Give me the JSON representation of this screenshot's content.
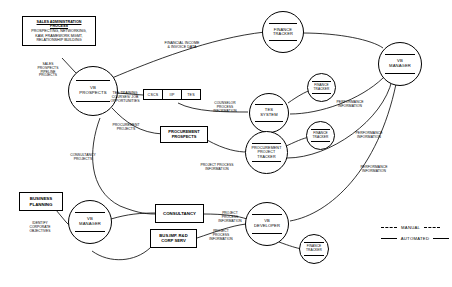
{
  "diagram": {
    "entities": [
      {
        "name": "sales-administration-process",
        "title": "SALES ADMINISTRATION",
        "title2": "PROCESS",
        "sub": "PROSPECTING, NETWORKING,\nKAM, FRAMEWORK MGMT,\nRELATIONSHIP BUILDING"
      },
      {
        "name": "procurement-prospects",
        "label": "PROCUREMENT\nPROSPECTS"
      },
      {
        "name": "business-planning",
        "label": "BUSINESS\nPLANNING"
      },
      {
        "name": "consultancy",
        "label": "CONSULTANCY"
      },
      {
        "name": "bus-imp-rd-corp-serv",
        "label": "BUS.IMP. R&D\nCORP SERV"
      }
    ],
    "processes": [
      {
        "name": "vb-prospects",
        "label": "VB\nPROSPECTS"
      },
      {
        "name": "finance-tracker-top",
        "label": "FINANCE\nTRACKER"
      },
      {
        "name": "vb-manager-right",
        "label": "VB\nMANAGER"
      },
      {
        "name": "finance-tracker-tes",
        "label": "FINANCE\nTRACKER"
      },
      {
        "name": "tes-system",
        "label": "TES\nSYSTEM"
      },
      {
        "name": "finance-tracker-procurement",
        "label": "FINANCE\nTRACKER"
      },
      {
        "name": "procurement-project-tracker",
        "label": "PROCUREMENT\nPROJECT\nTRACKER"
      },
      {
        "name": "vb-manager-bottom",
        "label": "VB\nMANAGER"
      },
      {
        "name": "vb-developer",
        "label": "VB\nDEVELOPER"
      },
      {
        "name": "finance-tracker-developer",
        "label": "FINANCE\nTRACKER"
      }
    ],
    "store": {
      "name": "accreditation-store",
      "cells": [
        "CSCS",
        "IIP",
        "TES"
      ]
    },
    "flows": [
      {
        "name": "flow-sales-prospects",
        "label": "SALES\nPROSPECTS\nPIPELINE\nPROJECTS"
      },
      {
        "name": "flow-financial-income",
        "label": "FINANCIAL INCOME\n& INVOICE DATA"
      },
      {
        "name": "flow-tes-training",
        "label": "TES TRAINING\nCOURSES/ JOB\nOPPORTUNITIES"
      },
      {
        "name": "flow-counselor-process",
        "label": "COUNSELOR\nPROCESS\nINFORMATION"
      },
      {
        "name": "flow-performance-top",
        "label": "PERFORMANCE\nINFORMATION"
      },
      {
        "name": "flow-procurement-projects",
        "label": "PROCUREMENT\nPROJECTS"
      },
      {
        "name": "flow-performance-mid",
        "label": "PERFORMANCE\nINFORMATION"
      },
      {
        "name": "flow-consultancy-projects",
        "label": "CONSULTANCY\nPROJECTS"
      },
      {
        "name": "flow-project-process-procurement",
        "label": "PROJECT PROCESS\nINFORMATION"
      },
      {
        "name": "flow-performance-low",
        "label": "PERFORMANCE\nINFORMATION"
      },
      {
        "name": "flow-identify-objectives",
        "label": "IDENTIFY\nCORPORATE\nOBJECTIVES"
      },
      {
        "name": "flow-project-process-consultancy",
        "label": "PROJECT\nPROCESS\nINFORMATION"
      },
      {
        "name": "flow-project-process-busimp",
        "label": "PROJECT\nPROCESS\nINFORMATION"
      }
    ],
    "legend": [
      {
        "name": "legend-manual",
        "label": "MANUAL",
        "style": "dashed"
      },
      {
        "name": "legend-automated",
        "label": "AUTOMATED",
        "style": "solid"
      }
    ],
    "colors": {
      "line": "#000000",
      "background": "#ffffff"
    }
  }
}
